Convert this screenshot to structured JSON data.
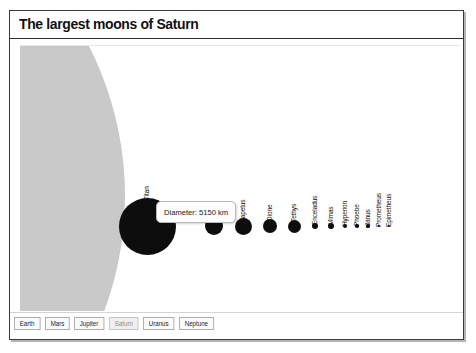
{
  "window": {
    "title": "The largest moons of Saturn"
  },
  "chart_data": {
    "type": "scatter",
    "title": "The largest moons of Saturn",
    "xlabel": "",
    "ylabel": "",
    "grid": false,
    "legend": "none",
    "encoding": "circle area proportional to moon diameter (km)",
    "central_body": {
      "name": "Saturn",
      "color": "#c9c9c9",
      "rendered": "partial disc clipped at left edge"
    },
    "categories": [
      "Titan",
      "Rhea",
      "Iapetus",
      "Dione",
      "Tethys",
      "Enceladus",
      "Mimas",
      "Hyperion",
      "Phoebe",
      "Janus",
      "Prometheus",
      "Epimetheus"
    ],
    "values": [
      5150,
      1528,
      1436,
      1123,
      1062,
      504,
      396,
      270,
      213,
      179,
      119,
      113
    ],
    "units": "km",
    "points": [
      {
        "label": "Titan",
        "diameter_km": 5150,
        "cx": 127,
        "cy": 180,
        "r": 28.5
      },
      {
        "label": "Rhea",
        "diameter_km": 1528,
        "cx": 194,
        "cy": 180,
        "r": 9.0
      },
      {
        "label": "Iapetus",
        "diameter_km": 1436,
        "cx": 223,
        "cy": 180,
        "r": 8.5
      },
      {
        "label": "Dione",
        "diameter_km": 1123,
        "cx": 250,
        "cy": 180,
        "r": 7.0
      },
      {
        "label": "Tethys",
        "diameter_km": 1062,
        "cx": 274,
        "cy": 180,
        "r": 6.5
      },
      {
        "label": "Enceladus",
        "diameter_km": 504,
        "cx": 295,
        "cy": 180,
        "r": 3.4
      },
      {
        "label": "Mimas",
        "diameter_km": 396,
        "cx": 311,
        "cy": 180,
        "r": 2.9
      },
      {
        "label": "Hyperion",
        "diameter_km": 270,
        "cx": 325,
        "cy": 180,
        "r": 2.2
      },
      {
        "label": "Phoebe",
        "diameter_km": 213,
        "cx": 337,
        "cy": 180,
        "r": 1.8
      },
      {
        "label": "Janus",
        "diameter_km": 179,
        "cx": 348,
        "cy": 180,
        "r": 1.6
      },
      {
        "label": "Prometheus",
        "diameter_km": 119,
        "cx": 359,
        "cy": 180,
        "r": 1.2
      },
      {
        "label": "Epimetheus",
        "diameter_km": 113,
        "cx": 369,
        "cy": 180,
        "r": 1.1
      }
    ],
    "annotation": {
      "text": "Diameter: 5150 km",
      "target": "Titan"
    }
  },
  "tooltip": {
    "text": "Diameter: 5150 km"
  },
  "tabs": {
    "items": [
      {
        "label": "Earth",
        "active": false
      },
      {
        "label": "Mars",
        "active": false
      },
      {
        "label": "Jupiter",
        "active": false
      },
      {
        "label": "Saturn",
        "active": true
      },
      {
        "label": "Uranus",
        "active": false
      },
      {
        "label": "Neptune",
        "active": false
      }
    ]
  },
  "colors": {
    "moon": "#0d0d0d",
    "saturn": "#c9c9c9",
    "border": "#3a3a3a",
    "text": "#111111"
  }
}
